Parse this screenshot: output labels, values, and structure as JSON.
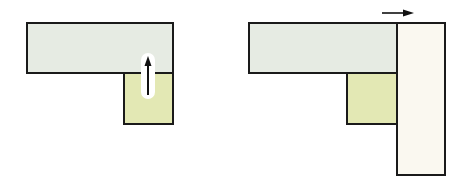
{
  "diagram": {
    "panels": [
      {
        "id": "before",
        "shapes": [
          {
            "name": "horizontal-bar",
            "x": 26,
            "y": 22,
            "w": 148,
            "h": 52,
            "fill": "#e6ebe3"
          },
          {
            "name": "small-square",
            "x": 123,
            "y": 72,
            "w": 51,
            "h": 53,
            "fill": "#e3e8b4"
          }
        ],
        "arrow": {
          "direction": "up",
          "x": 148,
          "y1": 95,
          "y2": 57
        }
      },
      {
        "id": "after",
        "shapes": [
          {
            "name": "horizontal-bar",
            "x": 248,
            "y": 22,
            "w": 150,
            "h": 52,
            "fill": "#e6ebe3"
          },
          {
            "name": "small-square",
            "x": 346,
            "y": 72,
            "w": 52,
            "h": 53,
            "fill": "#e3e8b4"
          },
          {
            "name": "vertical-bar",
            "x": 396,
            "y": 22,
            "w": 50,
            "h": 154,
            "fill": "#faf8f0"
          }
        ],
        "arrow": {
          "direction": "right",
          "y": 13,
          "x1": 382,
          "x2": 413
        }
      }
    ],
    "colors": {
      "outline": "#1a1a1a",
      "grey_green": "#e6ebe3",
      "yellow_green": "#e3e8b4",
      "cream": "#faf8f0"
    }
  }
}
